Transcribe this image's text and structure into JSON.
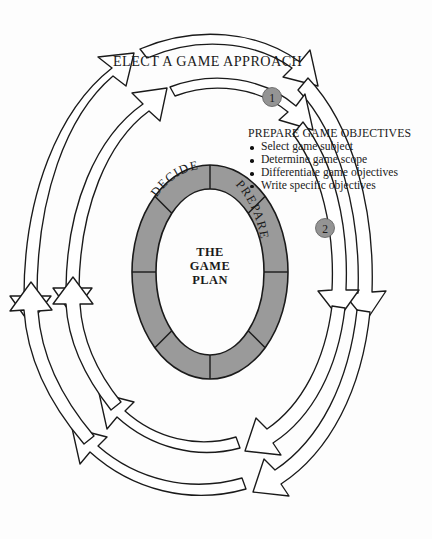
{
  "diagram": {
    "title": "The Game Plan",
    "type": "cyclical-process-wheel",
    "background_color": "#fdfdfd",
    "ring_fill_color": "#9a9a9a",
    "ring_stroke_color": "#1a1a1a",
    "arrow_fill_color": "#ffffff",
    "arrow_stroke_color": "#1a1a1a",
    "marker_fill_color": "#949494"
  },
  "heading": {
    "text": "ELECT A GAME APPROACH"
  },
  "callout": {
    "title": "PREPARE GAME OBJECTIVES",
    "items": [
      "Select game subject",
      "Determine game scope",
      "Differentiate game objectives",
      "Write specific objectives"
    ]
  },
  "center": {
    "line1": "THE",
    "line2": "GAME",
    "line3": "PLAN"
  },
  "ring": {
    "segment_labels": [
      {
        "text": "DECIDE"
      },
      {
        "text": "PREPARE"
      }
    ],
    "segment_count": 8
  },
  "markers": [
    {
      "label": "1"
    },
    {
      "label": "2"
    }
  ]
}
